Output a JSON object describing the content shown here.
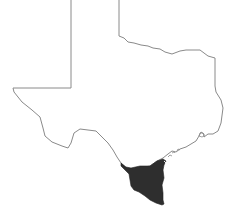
{
  "map": {
    "subject": "Texas state outline",
    "highlighted_region": "South Texas (Rio Grande Valley / Coastal Bend)",
    "colors": {
      "background": "#ffffff",
      "outline": "#8a8a8a",
      "highlight_fill": "#2e2e2e"
    },
    "outline_points": "71,0 71,88 13,88 14,92 22,102 32,110 40,117 43,128 45,136 52,142 62,146 68,148 71,143 74,133 80,129 88,130 96,131 102,137 108,143 113,150 117,157 121,163 126,168 131,170",
    "coast_points": "131,170 139,168 150,166 157,161 163,158 168,154 172,151 176,152 180,149 186,147 191,144 196,141 199,136 201,132 204,134 204,137 208,134 213,134 218,131",
    "east_points": "218,131 221,123 223,108 221,100 216,92 215,86 215,58 208,56 200,50 192,50 186,50 180,51 172,54 165,52 160,49 153,48 148,46 141,45 134,43 128,42 124,38 119,36 119,0",
    "highlight_points": "121,163 126,167 131,168 140,166 150,166 157,161 163,159 166,161 164,165 163,170 164,178 162,185 163,193 163,200 164,204 162,205 156,203 150,200 145,196 139,192 134,190 131,186 130,180 129,174 125,170 121,166"
  }
}
